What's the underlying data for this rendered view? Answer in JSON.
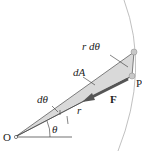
{
  "diagram": {
    "labels": {
      "r_dtheta": "r dθ",
      "dA": "dA",
      "dtheta": "dθ",
      "F": "F",
      "r": "r",
      "theta": "θ",
      "O": "O",
      "P": "P"
    },
    "colors": {
      "wedge_fill": "#d9d9d9",
      "arc": "#b0b0b0",
      "line": "#333333",
      "force_arrow": "#555555",
      "point": "#c8c8c8"
    }
  }
}
